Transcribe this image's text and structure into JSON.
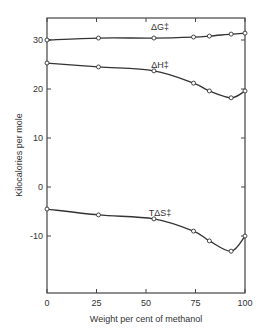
{
  "chart_data": {
    "type": "line",
    "title": "",
    "xlabel": "Weight per cent of methanol",
    "ylabel": "Kilocalories per mole",
    "xlim": [
      0,
      100
    ],
    "ylim": [
      -22,
      35
    ],
    "xticks": [
      0,
      25,
      50,
      75,
      100
    ],
    "xtick_labels": [
      "0",
      "25",
      "50",
      "75",
      "100"
    ],
    "yticks": [
      -10,
      0,
      10,
      20,
      30
    ],
    "ytick_labels": [
      "-10",
      "0",
      "10",
      "20",
      "30"
    ],
    "grid": false,
    "legend": "inline labels",
    "x": [
      0,
      26,
      54,
      74,
      82,
      93,
      100
    ],
    "series": [
      {
        "name": "ΔG‡",
        "label": "ΔG‡",
        "values": [
          30.0,
          30.4,
          30.4,
          30.6,
          30.8,
          31.2,
          31.4
        ]
      },
      {
        "name": "ΔH‡",
        "label": "ΔH‡",
        "values": [
          25.3,
          24.5,
          23.7,
          21.2,
          19.6,
          18.2,
          19.6
        ]
      },
      {
        "name": "TΔS‡",
        "label": "TΔS‡",
        "values": [
          -4.5,
          -5.7,
          -6.5,
          -9.0,
          -11.0,
          -13.1,
          -10.0
        ]
      }
    ],
    "colors": {
      "line": "#333333",
      "marker_fill": "#ffffff",
      "axis": "#444444"
    }
  }
}
